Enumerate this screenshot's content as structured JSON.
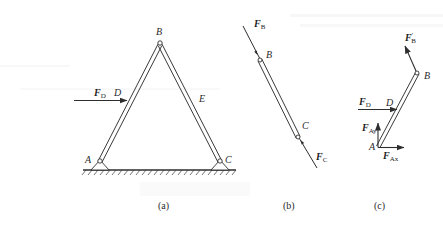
{
  "figures": {
    "a": {
      "caption": "(a)",
      "points": {
        "A": "A",
        "B": "B",
        "C": "C",
        "D": "D",
        "E": "E"
      },
      "force_D": {
        "symbol": "F",
        "subscript": "D"
      }
    },
    "b": {
      "caption": "(b)",
      "points": {
        "B": "B",
        "C": "C"
      },
      "force_B": {
        "symbol": "F",
        "subscript": "B"
      },
      "force_C": {
        "symbol": "F",
        "subscript": "C"
      }
    },
    "c": {
      "caption": "(c)",
      "points": {
        "A": "A",
        "B": "B",
        "D": "D"
      },
      "force_B_prime": {
        "symbol": "F",
        "prime": "′",
        "subscript": "B"
      },
      "force_D": {
        "symbol": "F",
        "subscript": "D"
      },
      "force_Ay": {
        "symbol": "F",
        "subscript": "Ay"
      },
      "force_Ax": {
        "symbol": "F",
        "subscript": "Ax"
      }
    }
  },
  "colors": {
    "line": "#2e2e2e",
    "background": "#ffffff"
  }
}
